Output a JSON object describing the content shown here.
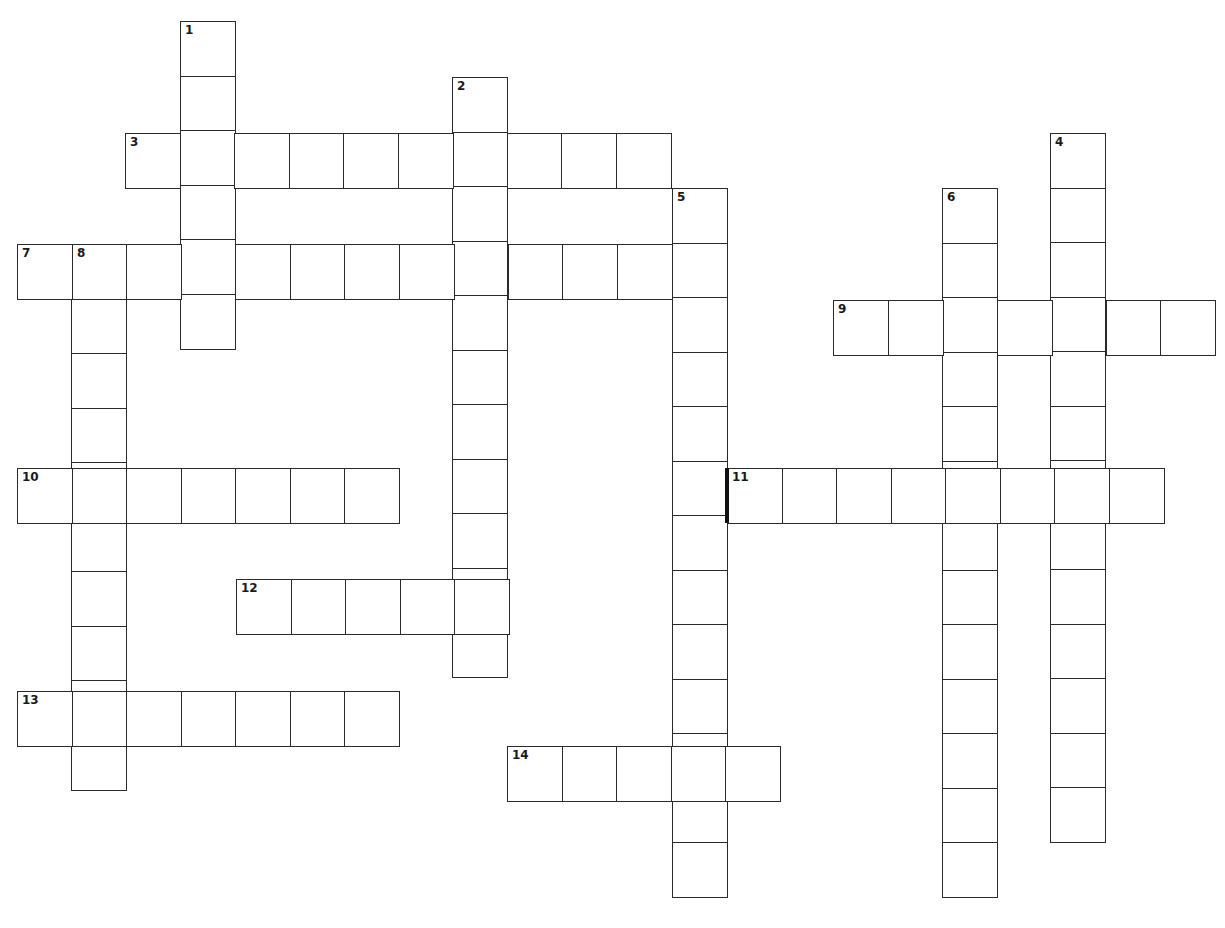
{
  "puzzle": {
    "type": "crossword",
    "cell_size": 54.5,
    "border_color": "#2a2a2a",
    "background": "#ffffff",
    "words": [
      {
        "number": "1",
        "direction": "down",
        "x": 180,
        "y": 21,
        "length": 6
      },
      {
        "number": "2",
        "direction": "down",
        "x": 452,
        "y": 77,
        "length": 11
      },
      {
        "number": "3",
        "direction": "across",
        "x": 125,
        "y": 133,
        "length": 10
      },
      {
        "number": "4",
        "direction": "down",
        "x": 1050,
        "y": 133,
        "length": 13
      },
      {
        "number": "5",
        "direction": "down",
        "x": 672,
        "y": 188,
        "length": 13
      },
      {
        "number": "6",
        "direction": "down",
        "x": 942,
        "y": 188,
        "length": 13
      },
      {
        "number": "7",
        "direction": "across",
        "x": 17,
        "y": 244,
        "length": 13
      },
      {
        "number": "8",
        "direction": "down",
        "x": 71,
        "y": 244,
        "length": 10
      },
      {
        "number": "9",
        "direction": "across",
        "x": 833,
        "y": 300,
        "length": 7
      },
      {
        "number": "10",
        "direction": "across",
        "x": 17,
        "y": 468,
        "length": 7
      },
      {
        "number": "11",
        "direction": "across",
        "x": 727,
        "y": 468,
        "length": 8
      },
      {
        "number": "12",
        "direction": "across",
        "x": 236,
        "y": 579,
        "length": 5
      },
      {
        "number": "13",
        "direction": "across",
        "x": 17,
        "y": 691,
        "length": 7
      },
      {
        "number": "14",
        "direction": "across",
        "x": 507,
        "y": 746,
        "length": 5
      }
    ],
    "cursor": {
      "word": "11",
      "x": 725,
      "y": 468,
      "height": 55
    }
  }
}
